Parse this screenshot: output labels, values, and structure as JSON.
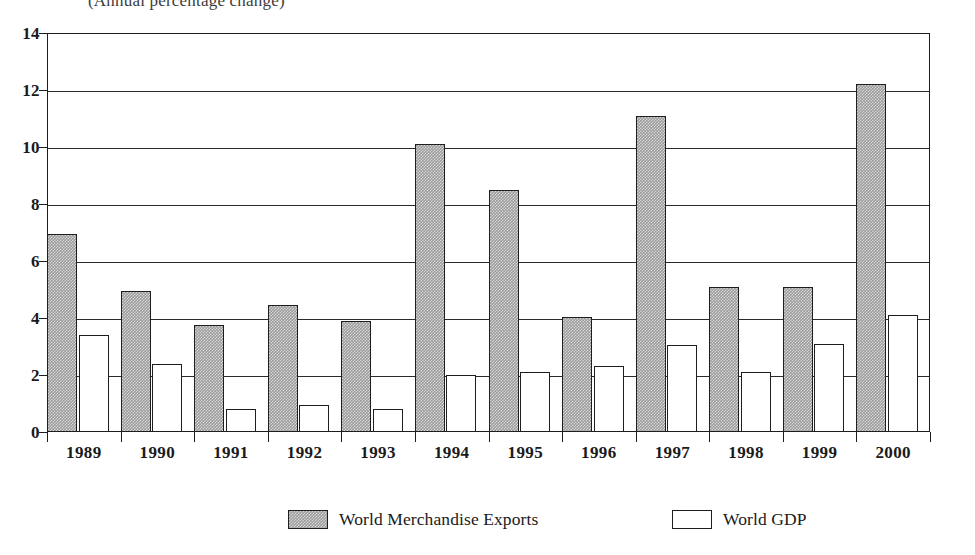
{
  "chart_data": {
    "type": "bar",
    "title": "",
    "subtitle": "(Annual percentage change)",
    "xlabel": "",
    "ylabel": "",
    "ylim": [
      0,
      14
    ],
    "ytick_step": 2,
    "yticks": [
      "0",
      "2",
      "4",
      "6",
      "8",
      "10",
      "12",
      "14"
    ],
    "grid": true,
    "legend_position": "bottom",
    "categories": [
      "1989",
      "1990",
      "1991",
      "1992",
      "1993",
      "1994",
      "1995",
      "1996",
      "1997",
      "1998",
      "1999",
      "2000"
    ],
    "series": [
      {
        "name": "World Merchandise Exports",
        "color": "#9c9c9c",
        "values": [
          6.95,
          4.95,
          3.75,
          4.45,
          3.9,
          10.1,
          8.5,
          4.05,
          11.1,
          5.1,
          5.1,
          12.2
        ]
      },
      {
        "name": "World GDP",
        "color": "#ffffff",
        "values": [
          3.4,
          2.4,
          0.8,
          0.95,
          0.8,
          2.0,
          2.1,
          2.3,
          3.05,
          2.1,
          3.1,
          4.1
        ]
      }
    ]
  },
  "legend": {
    "entries": [
      {
        "label": "World Merchandise Exports",
        "swatch": "exports"
      },
      {
        "label": "World GDP",
        "swatch": "gdp"
      }
    ]
  }
}
